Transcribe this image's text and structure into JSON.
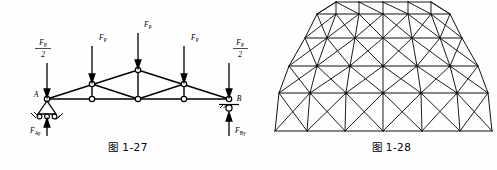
{
  "page": {
    "background": "#fefefe",
    "ink": "#000000"
  },
  "figures": [
    {
      "id": "truss",
      "caption": "图 1-27",
      "type": "statics-truss-free-body-diagram",
      "support_labels": {
        "left": "A",
        "right": "B"
      },
      "applied_loads": [
        {
          "name": "load-left-half",
          "numerator": "F",
          "num_sub": "P",
          "denominator": "2"
        },
        {
          "name": "load-panel-1",
          "numerator": "F",
          "num_sub": "P",
          "denominator": ""
        },
        {
          "name": "load-apex",
          "numerator": "F",
          "num_sub": "P",
          "denominator": ""
        },
        {
          "name": "load-panel-2",
          "numerator": "F",
          "num_sub": "P",
          "denominator": ""
        },
        {
          "name": "load-right-half",
          "numerator": "F",
          "num_sub": "P",
          "denominator": "2"
        }
      ],
      "reactions": [
        {
          "name": "reaction-a-vertical",
          "symbol": "F",
          "sub": "Ay"
        },
        {
          "name": "reaction-b-vertical",
          "symbol": "F",
          "sub": "By"
        }
      ],
      "supports": [
        {
          "name": "pin-support-a",
          "kind": "pin-roller-triangle"
        },
        {
          "name": "roller-support-b",
          "kind": "roller-on-hatched-ground"
        }
      ]
    },
    {
      "id": "dome",
      "caption": "图 1-28",
      "type": "geodesic-lattice-dome-elevation",
      "description": "braced dome elevation with horizontal rings, vertical posts and diagonal cross bracing"
    }
  ]
}
